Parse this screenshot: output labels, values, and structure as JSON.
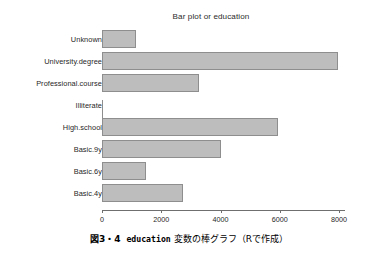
{
  "chart_data": {
    "type": "bar",
    "orientation": "horizontal",
    "title": "Bar plot or education",
    "xlabel": "",
    "ylabel": "",
    "categories": [
      "Unknown",
      "University.degree",
      "Professional.course",
      "Illiterate",
      "High.school",
      "Basic.9y",
      "Basic.6y",
      "Basic.4y"
    ],
    "values": [
      1150,
      7950,
      3280,
      20,
      5950,
      4020,
      1470,
      2750
    ],
    "xlim": [
      0,
      8200
    ],
    "xticks": [
      0,
      2000,
      4000,
      6000,
      8000
    ],
    "xtick_labels": [
      "0",
      "2000",
      "4000",
      "6000",
      "8000"
    ],
    "grid": false,
    "legend": null,
    "bar_fill_color": "#bdbdbd",
    "bar_border_color": "#8e8e8e",
    "axis_color": "#6f6f6f"
  },
  "caption": {
    "figure_number": "図3・4",
    "code_word": "education",
    "text_tail": "変数の棒グラフ（Rで作成）"
  }
}
